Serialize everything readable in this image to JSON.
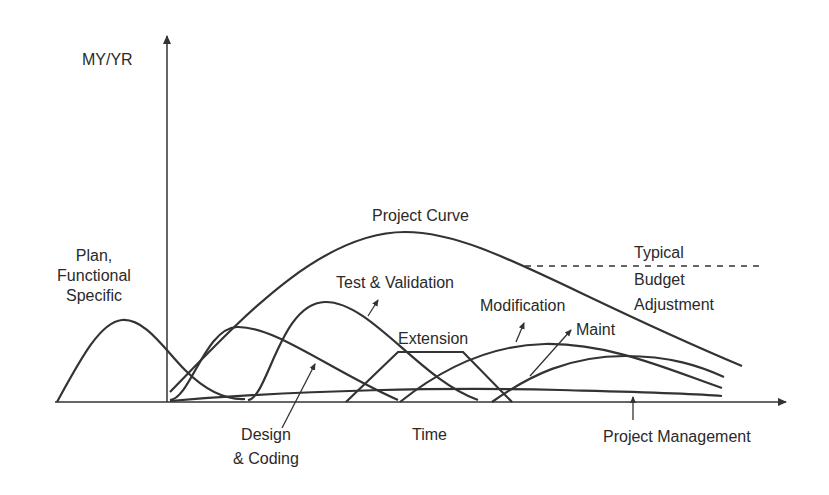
{
  "diagram": {
    "type": "software-life-cycle-effort-curves",
    "y_axis_label": "MY/YR",
    "x_axis_label": "Time",
    "labels": {
      "plan": [
        "Plan,",
        "Functional",
        "Specific"
      ],
      "project_curve": "Project Curve",
      "test_validation": "Test & Validation",
      "modification": "Modification",
      "extension": "Extension",
      "maint": "Maint",
      "budget": [
        "Typical",
        "Budget",
        "Adjustment"
      ],
      "design": [
        "Design",
        "& Coding"
      ],
      "project_management": "Project Management"
    },
    "colors": {
      "line": "#333333",
      "text": "#2a2a2a",
      "background": "#ffffff"
    }
  }
}
